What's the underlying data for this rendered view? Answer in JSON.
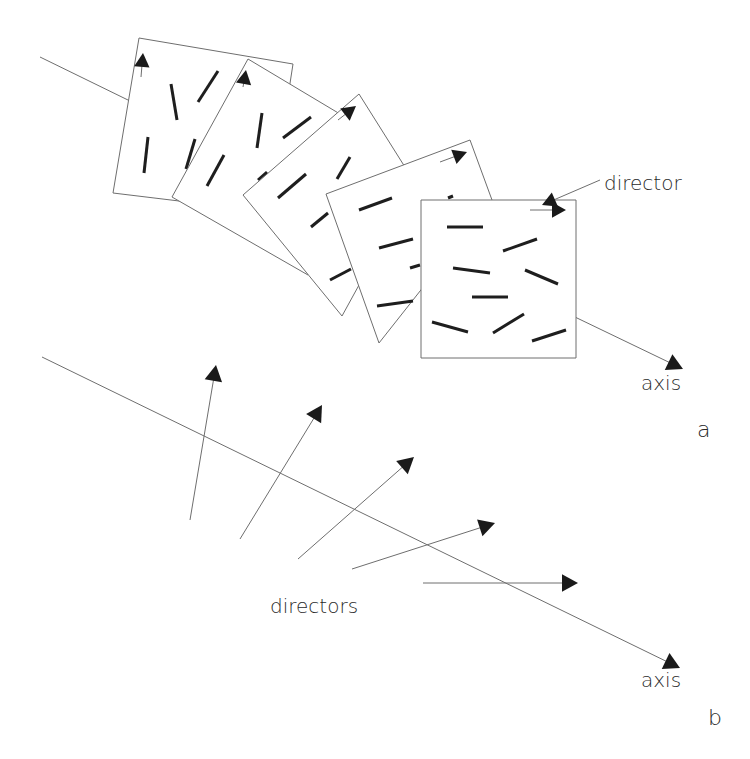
{
  "figure": {
    "width": 750,
    "height": 759,
    "colors": {
      "line": "#6e6e6e",
      "rod": "#1e1e1e",
      "arrowhead": "#1a1a1a",
      "text": "#2a2a2a",
      "background": "#ffffff"
    }
  },
  "panel_a": {
    "label": "a",
    "label_pos": [
      697,
      437
    ],
    "axis_label": "axis",
    "axis_label_pos": [
      641,
      390
    ],
    "director_label": "director",
    "director_label_pos": [
      604,
      190
    ],
    "axis_segments": [
      {
        "x1": 40,
        "y1": 57,
        "x2": 130,
        "y2": 101,
        "arrow": false
      },
      {
        "x1": 498,
        "y1": 280,
        "x2": 683,
        "y2": 369,
        "arrow": true
      }
    ],
    "director_pointer": {
      "x1": 600,
      "y1": 180,
      "x2": 542,
      "y2": 205,
      "arrow": true
    },
    "layers": [
      {
        "name": "layer-1",
        "polygon": [
          [
            139,
            38
          ],
          [
            293,
            64
          ],
          [
            270,
            212
          ],
          [
            113,
            193
          ]
        ],
        "director": {
          "x1": 141,
          "y1": 77,
          "x2": 143,
          "y2": 53
        },
        "rods": [
          [
            171,
            84,
            177,
            120
          ],
          [
            198,
            102,
            218,
            71
          ],
          [
            148,
            137,
            144,
            173
          ],
          [
            186,
            169,
            195,
            139
          ]
        ]
      },
      {
        "name": "layer-2",
        "polygon": [
          [
            248,
            59
          ],
          [
            345,
            117
          ],
          [
            308,
            275
          ],
          [
            172,
            197
          ]
        ],
        "director": {
          "x1": 243,
          "y1": 87,
          "x2": 246,
          "y2": 70
        },
        "rods": [
          [
            257,
            148,
            262,
            113
          ],
          [
            283,
            138,
            311,
            117
          ],
          [
            207,
            186,
            224,
            155
          ],
          [
            258,
            180,
            267,
            172
          ]
        ]
      },
      {
        "name": "layer-3",
        "polygon": [
          [
            359,
            94
          ],
          [
            415,
            183
          ],
          [
            342,
            316
          ],
          [
            243,
            195
          ]
        ],
        "director": {
          "x1": 338,
          "y1": 120,
          "x2": 356,
          "y2": 106
        },
        "rods": [
          [
            337,
            179,
            350,
            157
          ],
          [
            278,
            198,
            306,
            174
          ],
          [
            311,
            227,
            328,
            213
          ],
          [
            330,
            280,
            351,
            269
          ]
        ]
      },
      {
        "name": "layer-4",
        "polygon": [
          [
            470,
            140
          ],
          [
            492,
            200
          ],
          [
            379,
            343
          ],
          [
            326,
            194
          ]
        ],
        "director": {
          "x1": 440,
          "y1": 162,
          "x2": 467,
          "y2": 152
        },
        "rods": [
          [
            359,
            210,
            392,
            198
          ],
          [
            379,
            248,
            413,
            239
          ],
          [
            410,
            268,
            420,
            265
          ],
          [
            377,
            306,
            413,
            301
          ],
          [
            448,
            198,
            453,
            196
          ]
        ]
      },
      {
        "name": "layer-5",
        "polygon": [
          [
            421,
            200
          ],
          [
            576,
            200
          ],
          [
            576,
            358
          ],
          [
            421,
            358
          ]
        ],
        "director": {
          "x1": 530,
          "y1": 210,
          "x2": 566,
          "y2": 210
        },
        "rods": [
          [
            447,
            227,
            483,
            227
          ],
          [
            503,
            251,
            537,
            239
          ],
          [
            453,
            268,
            490,
            273
          ],
          [
            525,
            270,
            558,
            284
          ],
          [
            472,
            297,
            508,
            297
          ],
          [
            432,
            322,
            468,
            332
          ],
          [
            493,
            333,
            524,
            314
          ],
          [
            532,
            341,
            566,
            330
          ]
        ]
      }
    ]
  },
  "panel_b": {
    "label": "b",
    "label_pos": [
      708,
      725
    ],
    "axis_label": "axis",
    "axis_label_pos": [
      641,
      687
    ],
    "directors_label": "directors",
    "directors_label_pos": [
      270,
      613
    ],
    "axis": {
      "x1": 42,
      "y1": 357,
      "x2": 680,
      "y2": 668
    },
    "directors": [
      {
        "x1": 190,
        "y1": 520,
        "x2": 216,
        "y2": 365
      },
      {
        "x1": 240,
        "y1": 539,
        "x2": 322,
        "y2": 405
      },
      {
        "x1": 298,
        "y1": 559,
        "x2": 414,
        "y2": 457
      },
      {
        "x1": 352,
        "y1": 569,
        "x2": 495,
        "y2": 523
      },
      {
        "x1": 423,
        "y1": 583,
        "x2": 578,
        "y2": 583
      }
    ]
  }
}
